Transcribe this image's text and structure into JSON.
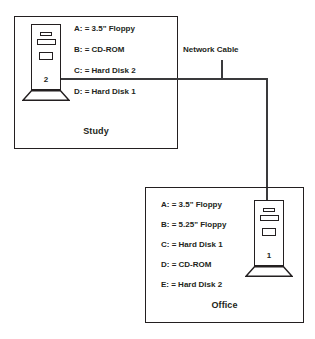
{
  "diagram": {
    "network": {
      "cable_label": "Network Cable",
      "line_color": "#3a3a3c"
    },
    "rooms": [
      {
        "id": "study",
        "label": "Study",
        "computer": {
          "number": "2",
          "icon": "desktop-tower-icon"
        },
        "drives": [
          "A: = 3.5\" Floppy",
          "B: = CD-ROM",
          "C: = Hard Disk 2",
          "D: = Hard Disk 1"
        ]
      },
      {
        "id": "office",
        "label": "Office",
        "computer": {
          "number": "1",
          "icon": "desktop-tower-icon"
        },
        "drives": [
          "A: = 3.5\" Floppy",
          "B: = 5.25\" Floppy",
          "C: = Hard Disk 1",
          "D: = CD-ROM",
          "E: = Hard Disk 2"
        ]
      }
    ]
  }
}
